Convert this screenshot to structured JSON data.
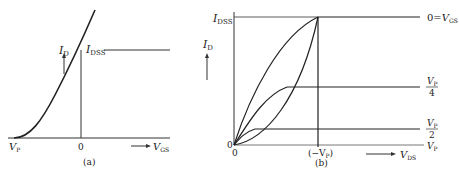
{
  "panel_a": {
    "caption": "(a)",
    "y_label": "I",
    "y_label_sub": "D",
    "idss_label": "I",
    "idss_sub": "DSS",
    "origin_label": "0",
    "vp_label": "V",
    "vp_sub": "P",
    "x_label": "V",
    "x_sub": "GS"
  },
  "panel_b": {
    "caption": "(b)",
    "y_label": "I",
    "y_label_sub": "D",
    "idss_label": "I",
    "idss_sub": "DSS",
    "origin_y_label": "0",
    "origin_x_label": "0",
    "pinch_label": "(−V",
    "pinch_sub": "P",
    "pinch_close": ")",
    "x_label": "V",
    "x_sub": "DS",
    "curves": [
      {
        "label_prefix": "0=",
        "label": "V",
        "label_sub": "GS"
      },
      {
        "label_num": "V",
        "label_num_sub": "P",
        "label_den": "4"
      },
      {
        "label_num": "V",
        "label_num_sub": "P",
        "label_den": "2"
      },
      {
        "label": "V",
        "label_sub": "P"
      }
    ]
  }
}
